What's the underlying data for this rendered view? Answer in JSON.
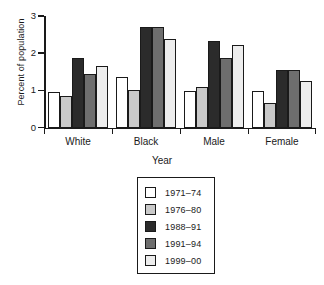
{
  "chart_data": {
    "type": "bar",
    "title": "",
    "xlabel": "Year",
    "ylabel": "Percent of population",
    "categories": [
      "White",
      "Black",
      "Male",
      "Female"
    ],
    "ylim": [
      0,
      3
    ],
    "yticks": [
      0,
      1,
      2,
      3
    ],
    "ytick_labels": [
      "0",
      "1",
      "2",
      "3"
    ],
    "grid": false,
    "legend_position": "below-center",
    "series": [
      {
        "name": "1971–74",
        "color": "#ffffff",
        "values": [
          0.95,
          1.35,
          0.97,
          0.98
        ]
      },
      {
        "name": "1976–80",
        "color": "#c9c9c9",
        "values": [
          0.85,
          1.02,
          1.08,
          0.67
        ]
      },
      {
        "name": "1988–91",
        "color": "#2b2b2b",
        "values": [
          1.88,
          2.7,
          2.33,
          1.55
        ]
      },
      {
        "name": "1991–94",
        "color": "#6e6e6e",
        "values": [
          1.45,
          2.7,
          1.88,
          1.54
        ]
      },
      {
        "name": "1999–00",
        "color": "#ededed",
        "values": [
          1.65,
          2.38,
          2.23,
          1.24
        ]
      }
    ]
  },
  "axis": {
    "ylabel": "Percent of population",
    "xlabel": "Year",
    "tick_labels": [
      "3",
      "2",
      "1",
      "0"
    ]
  },
  "legend": {
    "items": [
      {
        "label": "1971–74",
        "color": "#ffffff"
      },
      {
        "label": "1976–80",
        "color": "#c9c9c9"
      },
      {
        "label": "1988–91",
        "color": "#2b2b2b"
      },
      {
        "label": "1991–94",
        "color": "#6e6e6e"
      },
      {
        "label": "1999–00",
        "color": "#ededed"
      }
    ]
  },
  "groups": [
    {
      "label": "White"
    },
    {
      "label": "Black"
    },
    {
      "label": "Male"
    },
    {
      "label": "Female"
    }
  ]
}
